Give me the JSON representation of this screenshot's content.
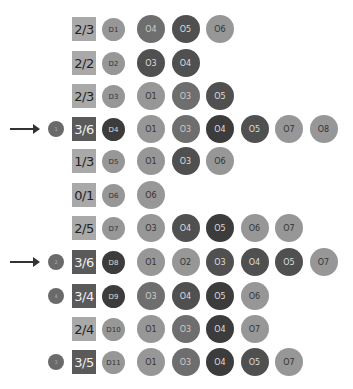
{
  "rows": [
    {
      "fraction": "2/3",
      "sq": "light",
      "d": {
        "label": "D1",
        "c": "c1"
      },
      "marker": null,
      "o": [
        {
          "label": "O4",
          "c": "c2"
        },
        {
          "label": "O5",
          "c": "c3"
        },
        {
          "label": "O6",
          "c": "c1"
        }
      ]
    },
    {
      "fraction": "2/2",
      "sq": "light",
      "d": {
        "label": "D2",
        "c": "c1"
      },
      "marker": null,
      "o": [
        {
          "label": "O3",
          "c": "c3"
        },
        {
          "label": "O4",
          "c": "c3"
        }
      ]
    },
    {
      "fraction": "2/3",
      "sq": "light",
      "d": {
        "label": "D3",
        "c": "c1"
      },
      "marker": null,
      "o": [
        {
          "label": "O1",
          "c": "c1"
        },
        {
          "label": "O3",
          "c": "c2"
        },
        {
          "label": "O5",
          "c": "c3"
        }
      ]
    },
    {
      "fraction": "3/6",
      "sq": "dark",
      "d": {
        "label": "D4",
        "c": "c4"
      },
      "marker": "1",
      "o": [
        {
          "label": "O1",
          "c": "c1"
        },
        {
          "label": "O3",
          "c": "c2"
        },
        {
          "label": "O4",
          "c": "c4"
        },
        {
          "label": "O5",
          "c": "c3"
        },
        {
          "label": "O7",
          "c": "c1"
        },
        {
          "label": "O8",
          "c": "c1"
        }
      ]
    },
    {
      "fraction": "1/3",
      "sq": "light",
      "d": {
        "label": "D5",
        "c": "c1"
      },
      "marker": null,
      "o": [
        {
          "label": "O1",
          "c": "c1"
        },
        {
          "label": "O3",
          "c": "c3"
        },
        {
          "label": "O6",
          "c": "c1"
        }
      ]
    },
    {
      "fraction": "0/1",
      "sq": "light",
      "d": {
        "label": "D6",
        "c": "c1"
      },
      "marker": null,
      "o": [
        {
          "label": "O6",
          "c": "c1"
        }
      ]
    },
    {
      "fraction": "2/5",
      "sq": "light",
      "d": {
        "label": "D7",
        "c": "c1"
      },
      "marker": null,
      "o": [
        {
          "label": "O3",
          "c": "c1"
        },
        {
          "label": "O4",
          "c": "c3"
        },
        {
          "label": "O5",
          "c": "c4"
        },
        {
          "label": "O6",
          "c": "c1"
        },
        {
          "label": "O7",
          "c": "c1"
        }
      ]
    },
    {
      "fraction": "3/6",
      "sq": "dark",
      "d": {
        "label": "D8",
        "c": "c4"
      },
      "marker": "2",
      "o": [
        {
          "label": "O1",
          "c": "c1"
        },
        {
          "label": "O2",
          "c": "c1"
        },
        {
          "label": "O3",
          "c": "c3"
        },
        {
          "label": "O4",
          "c": "c3"
        },
        {
          "label": "O5",
          "c": "c3"
        },
        {
          "label": "O7",
          "c": "c1"
        }
      ]
    },
    {
      "fraction": "3/4",
      "sq": "dark",
      "d": {
        "label": "D9",
        "c": "c4"
      },
      "marker": "4",
      "o": [
        {
          "label": "O3",
          "c": "c2"
        },
        {
          "label": "O4",
          "c": "c3"
        },
        {
          "label": "O5",
          "c": "c4"
        },
        {
          "label": "O6",
          "c": "c1"
        }
      ]
    },
    {
      "fraction": "2/4",
      "sq": "light",
      "d": {
        "label": "D10",
        "c": "c1"
      },
      "marker": null,
      "o": [
        {
          "label": "O1",
          "c": "c1"
        },
        {
          "label": "O3",
          "c": "c2"
        },
        {
          "label": "O4",
          "c": "c4"
        },
        {
          "label": "O7",
          "c": "c1"
        }
      ]
    },
    {
      "fraction": "3/5",
      "sq": "dark",
      "d": {
        "label": "D11",
        "c": "c1"
      },
      "marker": "3",
      "o": [
        {
          "label": "O1",
          "c": "c1"
        },
        {
          "label": "O3",
          "c": "c2"
        },
        {
          "label": "O4",
          "c": "c4"
        },
        {
          "label": "O5",
          "c": "c3"
        },
        {
          "label": "O7",
          "c": "c1"
        }
      ]
    }
  ],
  "arrows_on_rows": [
    3,
    7
  ]
}
